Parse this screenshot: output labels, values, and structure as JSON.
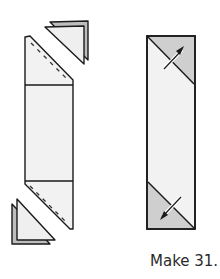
{
  "caption": "Make 31.",
  "colors": {
    "outline": "#1a1a1a",
    "light_fill": "#f2f2f2",
    "medium_fill": "#cfcfcf",
    "back_triangle_fill": "#bdbdbd",
    "seam_dash": "#333333"
  },
  "figures": [
    {
      "name": "unit-before-sewing",
      "description": "Rectangle strip with two triangles placed at opposite corners, dashed sewing lines"
    },
    {
      "name": "unit-after-pressing",
      "description": "Finished strip with shaded corner triangles and pressing arrows"
    }
  ]
}
